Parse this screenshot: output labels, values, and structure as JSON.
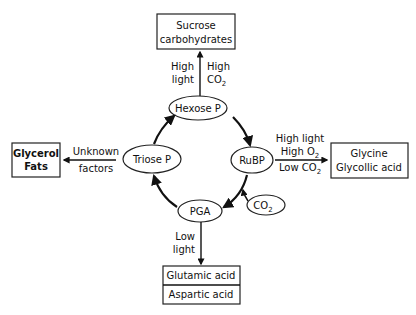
{
  "diagram": {
    "cycle": {
      "hexose": "Hexose P",
      "rubp": "RuBP",
      "pga": "PGA",
      "triose": "Triose P",
      "co2": "CO",
      "co2_sub": "2"
    },
    "top": {
      "box_line1": "Sucrose",
      "box_line2": "carbohydrates",
      "left_l1": "High",
      "left_l2": "light",
      "right_l1": "High",
      "right_l2": "CO",
      "right_l2_sub": "2"
    },
    "left": {
      "box_line1": "Glycerol",
      "box_line2": "Fats",
      "label_l1": "Unknown",
      "label_l2": "factors"
    },
    "right": {
      "box_line1": "Glycine",
      "box_line2": "Glycollic acid",
      "label_l1": "High light",
      "label_l2": "High O",
      "label_l2_sub": "2",
      "label_l3": "Low CO",
      "label_l3_sub": "2"
    },
    "bottom": {
      "box_line1": "Glutamic acid",
      "box_line2": "Aspartic acid",
      "label_l1": "Low",
      "label_l2": "light"
    }
  }
}
